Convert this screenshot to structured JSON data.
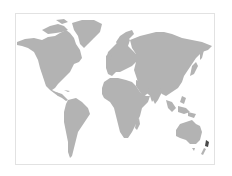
{
  "map": {
    "title": "World map",
    "projection": "Miller cylindrical",
    "land_color": "#b3b3b3",
    "highlight_color": "#4a4a4a",
    "frame_color": "#e2e2e2",
    "background_color": "#ffffff",
    "highlighted_region": "New Zealand",
    "regions": [
      "North America",
      "Greenland",
      "South America",
      "Europe",
      "Africa",
      "Asia",
      "Southeast Asia",
      "Australia",
      "New Zealand"
    ]
  }
}
